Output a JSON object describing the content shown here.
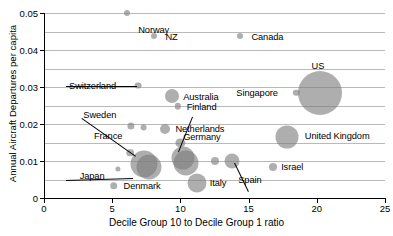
{
  "chart_data": {
    "type": "scatter",
    "title": "",
    "xlabel": "Decile Group 10 to Decile Group 1 ratio",
    "ylabel": "Annual Aircraft Departures per capita",
    "xlim": [
      0,
      25
    ],
    "ylim": [
      0,
      0.05
    ],
    "xticks": [
      0,
      5,
      10,
      15,
      20,
      25
    ],
    "xtick_labels": [
      "0",
      "5",
      "10",
      "15",
      "20",
      "25"
    ],
    "yticks": [
      0,
      0.01,
      0.02,
      0.03,
      0.04,
      0.05
    ],
    "ytick_labels": [
      "0",
      "0.01",
      "0.02",
      "0.03",
      "0.04",
      "0.05"
    ],
    "gridlines": [
      0.005,
      0.01,
      0.015,
      0.02,
      0.025,
      0.03,
      0.035,
      0.04,
      0.045,
      0.05
    ],
    "grid": true,
    "legend": "none",
    "bubble_color": "#7d7d7d",
    "bubble_opacity": 0.62,
    "points": [
      {
        "label": "Norway",
        "x": 6.1,
        "y": 0.05,
        "r": 3.0,
        "lx": 11,
        "ly": 12
      },
      {
        "label": "NZ",
        "x": 8.1,
        "y": 0.0437,
        "r": 3.0,
        "lx": 11,
        "ly": -4
      },
      {
        "label": "Canada",
        "x": 14.4,
        "y": 0.0437,
        "r": 3.0,
        "lx": 11,
        "ly": -4
      },
      {
        "label": "US",
        "x": 20.2,
        "y": 0.0285,
        "r": 22.0,
        "lx": -8,
        "ly": -32
      },
      {
        "label": "Switzerland",
        "x": 6.9,
        "y": 0.0304,
        "r": 3.4,
        "lx": -69,
        "ly": -5
      },
      {
        "label": "Australia",
        "x": 9.4,
        "y": 0.0277,
        "r": 7.0,
        "lx": 11,
        "ly": -4
      },
      {
        "label": "Finland",
        "x": 9.8,
        "y": 0.0248,
        "r": 3.2,
        "lx": 9,
        "ly": -4
      },
      {
        "label": "Singapore",
        "x": 18.5,
        "y": 0.0285,
        "r": 3.2,
        "lx": -60,
        "ly": -5
      },
      {
        "label": "Sweden",
        "x": 6.4,
        "y": 0.0195,
        "r": 3.6,
        "lx": -48,
        "ly": -16
      },
      {
        "label": "",
        "x": 7.3,
        "y": 0.019,
        "r": 3.4,
        "lx": 0,
        "ly": 0
      },
      {
        "label": "Netherlands",
        "x": 8.9,
        "y": 0.0187,
        "r": 5.0,
        "lx": 10,
        "ly": -5
      },
      {
        "label": "France",
        "x": 6.3,
        "y": 0.0122,
        "r": 3.8,
        "lx": -36,
        "ly": -22
      },
      {
        "label": "",
        "x": 7.3,
        "y": 0.0092,
        "r": 13.5,
        "lx": 0,
        "ly": 0
      },
      {
        "label": "",
        "x": 7.7,
        "y": 0.0083,
        "r": 12.5,
        "lx": 0,
        "ly": 0
      },
      {
        "label": "Japan",
        "x": 5.4,
        "y": 0.0079,
        "r": 2.6,
        "lx": -38,
        "ly": 2
      },
      {
        "label": "Denmark",
        "x": 5.1,
        "y": 0.0033,
        "r": 3.8,
        "lx": 10,
        "ly": -5
      },
      {
        "label": "Germany",
        "x": 10.2,
        "y": 0.0108,
        "r": 11.5,
        "lx": 0,
        "ly": -26
      },
      {
        "label": "",
        "x": 10.4,
        "y": 0.0094,
        "r": 12.5,
        "lx": 0,
        "ly": 0
      },
      {
        "label": "",
        "x": 10.0,
        "y": 0.0148,
        "r": 4.6,
        "lx": 0,
        "ly": 0
      },
      {
        "label": "Italy",
        "x": 11.2,
        "y": 0.004,
        "r": 9.5,
        "lx": 13,
        "ly": -5
      },
      {
        "label": "",
        "x": 12.5,
        "y": 0.0099,
        "r": 4.0,
        "lx": 0,
        "ly": 0
      },
      {
        "label": "Spain",
        "x": 13.8,
        "y": 0.0099,
        "r": 7.5,
        "lx": 6,
        "ly": 14
      },
      {
        "label": "Israel",
        "x": 16.8,
        "y": 0.0085,
        "r": 4.0,
        "lx": 8,
        "ly": -5
      },
      {
        "label": "United Kingdom",
        "x": 17.8,
        "y": 0.0165,
        "r": 11.5,
        "lx": 18,
        "ly": -6
      }
    ],
    "leaders": [
      {
        "from_label": "Switzerland",
        "x1": -3,
        "y1": 0,
        "x2": -1,
        "y2": 0
      },
      {
        "from_label": "France",
        "x1": -12,
        "y1": -18,
        "x2": 6,
        "y2": 3
      },
      {
        "from_label": "Japan",
        "x1": -14,
        "y1": 4,
        "x2": 15,
        "y2": 9
      },
      {
        "from_label": "Germany",
        "x1": 10,
        "y1": -20,
        "x2": -4,
        "y2": -6
      },
      {
        "from_label": "Spain",
        "x1": 10,
        "y1": 12,
        "x2": 2,
        "y2": 2
      }
    ]
  }
}
